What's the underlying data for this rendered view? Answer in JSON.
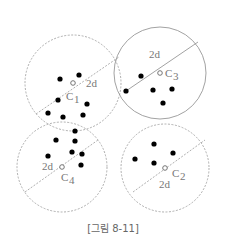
{
  "figure": {
    "caption": "[그림 8-11]",
    "colors": {
      "dashed_circle": "#9a9a9a",
      "solid_circle": "#8a8a8a",
      "point": "#000000",
      "label": "#777777"
    },
    "clusters": [
      {
        "id": "C1",
        "label_base": "C",
        "label_sub": "1",
        "diameter_label": "2d",
        "style": "dashed",
        "center": [
          73,
          83
        ],
        "radius": 48,
        "diameter_line": [
          [
            36,
            114
          ],
          [
            119,
            57
          ]
        ],
        "label_pos": [
          66,
          100
        ],
        "sub_pos": [
          74,
          103
        ],
        "diameter_label_pos": [
          86,
          87
        ],
        "points": [
          [
            60,
            79
          ],
          [
            79,
            75
          ],
          [
            58,
            100
          ],
          [
            87,
            104
          ],
          [
            48,
            113
          ],
          [
            63,
            117
          ],
          [
            83,
            115
          ]
        ]
      },
      {
        "id": "C3",
        "label_base": "C",
        "label_sub": "3",
        "diameter_label": "2d",
        "style": "solid",
        "center": [
          160,
          73
        ],
        "radius": 46,
        "diameter_line": [
          [
            126,
            91
          ],
          [
            198,
            42
          ]
        ],
        "label_pos": [
          165,
          77
        ],
        "sub_pos": [
          173,
          80
        ],
        "diameter_label_pos": [
          149,
          58
        ],
        "points": [
          [
            141,
            76
          ],
          [
            126,
            91
          ],
          [
            153,
            90
          ],
          [
            172,
            89
          ],
          [
            163,
            103
          ]
        ]
      },
      {
        "id": "C4",
        "label_base": "C",
        "label_sub": "4",
        "diameter_label": "2d",
        "style": "dashed",
        "center": [
          62,
          167
        ],
        "radius": 45,
        "diameter_line": [
          [
            25,
            192
          ],
          [
            98,
            140
          ]
        ],
        "label_pos": [
          61,
          181
        ],
        "sub_pos": [
          69,
          184
        ],
        "diameter_label_pos": [
          42,
          170
        ],
        "points": [
          [
            56,
            140
          ],
          [
            75,
            131
          ],
          [
            75,
            141
          ],
          [
            72,
            152
          ],
          [
            82,
            154
          ],
          [
            48,
            156
          ],
          [
            81,
            165
          ]
        ]
      },
      {
        "id": "C2",
        "label_base": "C",
        "label_sub": "2",
        "diameter_label": "2d",
        "style": "dashed",
        "center": [
          165,
          168
        ],
        "radius": 44,
        "diameter_line": [
          [
            133,
            192
          ],
          [
            205,
            140
          ]
        ],
        "label_pos": [
          172,
          177
        ],
        "sub_pos": [
          180,
          180
        ],
        "diameter_label_pos": [
          159,
          188
        ],
        "points": [
          [
            154,
            144
          ],
          [
            135,
            159
          ],
          [
            154,
            163
          ],
          [
            173,
            153
          ]
        ]
      }
    ]
  }
}
